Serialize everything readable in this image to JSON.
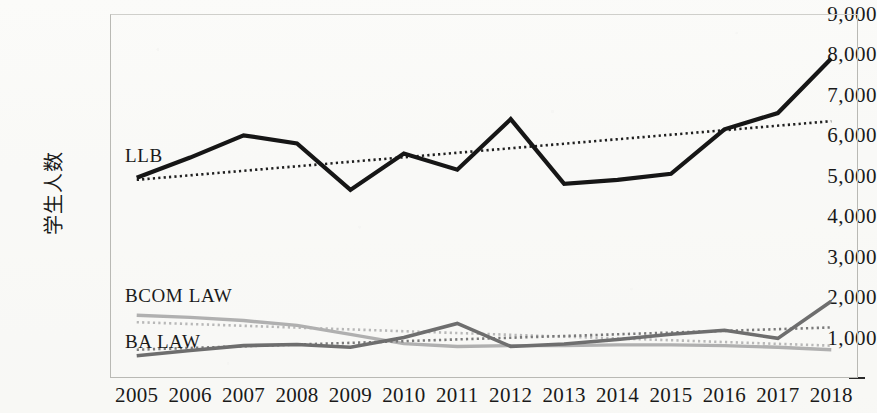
{
  "chart_data": {
    "type": "line",
    "title": "",
    "subtitle": "",
    "xlabel": "",
    "ylabel": "学生人数",
    "x": [
      2005,
      2006,
      2007,
      2008,
      2009,
      2010,
      2011,
      2012,
      2013,
      2014,
      2015,
      2016,
      2017,
      2018
    ],
    "xtick_labels": [
      "2005",
      "2006",
      "2007",
      "2008",
      "2009",
      "2010",
      "2011",
      "2012",
      "2013",
      "2014",
      "2015",
      "2016",
      "2017",
      "2018"
    ],
    "ytick_labels": [
      "-",
      "1,000",
      "2,000",
      "3,000",
      "4,000",
      "5,000",
      "6,000",
      "7,000",
      "8,000",
      "9,000"
    ],
    "ytick_values": [
      0,
      1000,
      2000,
      3000,
      4000,
      5000,
      6000,
      7000,
      8000,
      9000
    ],
    "ylim": [
      0,
      9000
    ],
    "xlim": [
      2005,
      2018
    ],
    "grid": false,
    "legend_position": "inline-labels",
    "series": [
      {
        "name": "LLB",
        "color": "#161616",
        "width": 4.2,
        "label_x": 2005.3,
        "values": [
          4950,
          5450,
          6000,
          5800,
          4650,
          5550,
          5150,
          6400,
          4800,
          4900,
          5050,
          6150,
          6550,
          7900
        ],
        "trendline": {
          "style": "dotted",
          "color": "#1f1f1f",
          "start": 4900,
          "end": 6350
        }
      },
      {
        "name": "BCOM LAW",
        "color": "#b0b0b0",
        "width": 3.4,
        "label_x": 2005.3,
        "values": [
          1550,
          1500,
          1420,
          1300,
          1080,
          850,
          780,
          800,
          800,
          820,
          820,
          800,
          760,
          700
        ],
        "trendline": {
          "style": "dotted",
          "color": "#b8b8b8",
          "start": 1380,
          "end": 800
        }
      },
      {
        "name": "BA LAW",
        "color": "#6e6e6e",
        "width": 3.6,
        "label_x": 2005.3,
        "values": [
          550,
          680,
          800,
          830,
          760,
          1000,
          1350,
          780,
          840,
          950,
          1080,
          1180,
          980,
          1900
        ],
        "trendline": {
          "style": "dotted",
          "color": "#7a7a7a",
          "start": 700,
          "end": 1250
        }
      }
    ]
  },
  "ghost_text": {
    "marks": [
      "— — —",
      "· · ·",
      "—  ·",
      "· — ·",
      "— · —",
      "·  —"
    ]
  }
}
